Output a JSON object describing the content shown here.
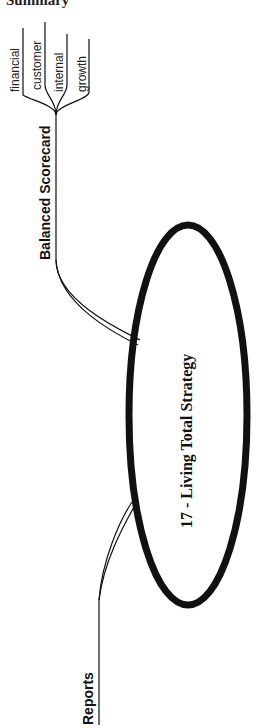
{
  "header": {
    "title": "Summary"
  },
  "mindmap": {
    "center": {
      "label": "17 - Living Total Strategy"
    },
    "branches": [
      {
        "label": "Balanced Scorecard",
        "children": [
          {
            "label": "financial"
          },
          {
            "label": "customer"
          },
          {
            "label": "internal"
          },
          {
            "label": "growth"
          }
        ]
      },
      {
        "label": "Reports",
        "children": []
      }
    ]
  },
  "colors": {
    "ink": "#111111",
    "background": "#ffffff"
  }
}
